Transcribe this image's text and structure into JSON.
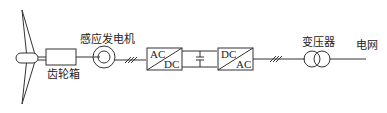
{
  "diagram": {
    "type": "wind-turbine-power-conversion-schematic",
    "components": {
      "gearbox": {
        "label": "齿轮箱"
      },
      "generator": {
        "label": "感应发电机"
      },
      "rectifier": {
        "top": "AC",
        "bottom": "DC"
      },
      "inverter": {
        "top": "DC",
        "bottom": "AC"
      },
      "transformer": {
        "label": "变压器"
      },
      "grid": {
        "label": "电网"
      }
    },
    "line_color": "#333333"
  }
}
